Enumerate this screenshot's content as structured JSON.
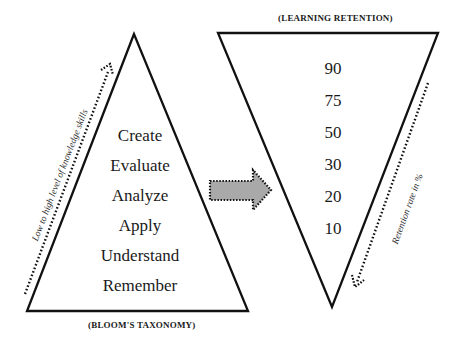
{
  "left_pyramid": {
    "caption": "(BLOOM'S TAXONOMY)",
    "levels": [
      "Create",
      "Evaluate",
      "Analyze",
      "Apply",
      "Understand",
      "Remember"
    ],
    "side_arrow_label": "Low to high level of knowledge skills"
  },
  "right_pyramid": {
    "caption": "(LEARNING RETENTION)",
    "values": [
      "90",
      "75",
      "50",
      "30",
      "20",
      "10"
    ],
    "side_arrow_label": "Retention rate in %"
  },
  "connector": {
    "shape": "block-arrow-right",
    "fill": "#a9a9a9",
    "border_style": "dotted"
  }
}
